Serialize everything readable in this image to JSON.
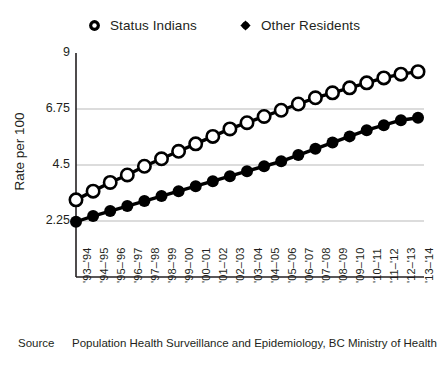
{
  "chart_data": {
    "type": "line",
    "title": "",
    "xlabel": "",
    "ylabel": "Rate per 100",
    "ylim": [
      0,
      9
    ],
    "yticks": [
      2.25,
      4.5,
      6.75,
      9
    ],
    "ytick_labels": [
      "2.25",
      "4.5",
      "6.75",
      "9"
    ],
    "grid": true,
    "legend_position": "top-center",
    "categories": [
      "'93–'94",
      "'94–'95",
      "'95–'96",
      "'96–'97",
      "'97–'98",
      "'98–'99",
      "'99–'00",
      "'00–'01",
      "'01–'02",
      "'02–'03",
      "'03–'04",
      "'04–'05",
      "'05–'06",
      "'06–'07",
      "'07–'08",
      "'08–'09",
      "'09–'10",
      "'10–'11",
      "'11–'12",
      "'12–'13",
      "'13–'14"
    ],
    "series": [
      {
        "name": "Status Indians",
        "marker": "open-circle",
        "color": "#000000",
        "values": [
          3.1,
          3.45,
          3.8,
          4.1,
          4.45,
          4.75,
          5.05,
          5.35,
          5.65,
          5.95,
          6.2,
          6.45,
          6.7,
          6.95,
          7.2,
          7.4,
          7.6,
          7.8,
          8.0,
          8.15,
          8.25
        ]
      },
      {
        "name": "Other Residents",
        "marker": "filled-circle",
        "color": "#000000",
        "values": [
          2.22,
          2.45,
          2.65,
          2.85,
          3.05,
          3.25,
          3.45,
          3.65,
          3.85,
          4.05,
          4.25,
          4.45,
          4.65,
          4.9,
          5.15,
          5.4,
          5.65,
          5.9,
          6.1,
          6.3,
          6.4
        ]
      }
    ]
  },
  "legend": {
    "items": [
      {
        "label": "Status Indians",
        "marker": "open-circle"
      },
      {
        "label": "Other Residents",
        "marker": "filled-circle"
      }
    ]
  },
  "axes": {
    "y_title": "Rate per 100"
  },
  "source": {
    "label": "Source",
    "text": "Population Health Surveillance and Epidemiology, BC Ministry of Health"
  }
}
